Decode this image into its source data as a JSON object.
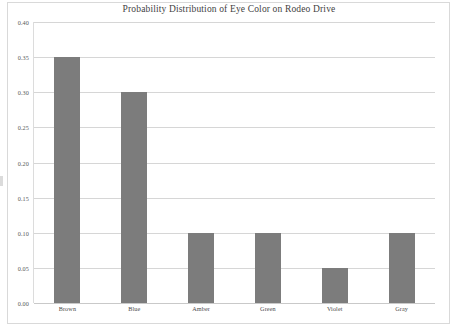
{
  "chart_data": {
    "type": "bar",
    "title": "Probability Distribution of Eye Color on Rodeo Drive",
    "subtitle": "",
    "xlabel": "",
    "ylabel": "",
    "categories": [
      "Brown",
      "Blue",
      "Amber",
      "Green",
      "Violet",
      "Gray"
    ],
    "values": [
      0.35,
      0.3,
      0.1,
      0.1,
      0.05,
      0.1
    ],
    "series": [
      {
        "name": "Probability",
        "values": [
          0.35,
          0.3,
          0.1,
          0.1,
          0.05,
          0.1
        ]
      }
    ],
    "ylim": [
      0.0,
      0.4
    ],
    "ytick_values": [
      0.0,
      0.05,
      0.1,
      0.15,
      0.2,
      0.25,
      0.3,
      0.35,
      0.4
    ],
    "ytick_labels": [
      "0.00",
      "0.05",
      "0.10",
      "0.15",
      "0.20",
      "0.25",
      "0.30",
      "0.35",
      "0.40"
    ],
    "grid": true,
    "grid_axis": "y",
    "legend": false,
    "legend_position": "none",
    "bar_color": "#7c7c7c",
    "gridline_color": "#d6d6d6",
    "title_color": "#3f3f3f",
    "tick_label_color": "#595959",
    "background_color": "#ffffff",
    "border_color": "#d9d9d9",
    "annotations": []
  }
}
